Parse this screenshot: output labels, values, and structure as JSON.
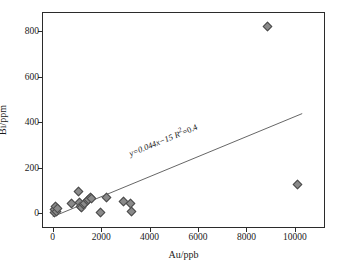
{
  "chart_data": {
    "type": "scatter",
    "title": "",
    "xlabel": "Au/ppb",
    "ylabel": "Bi/ppm",
    "xlim": [
      -400,
      11200
    ],
    "ylim": [
      -60,
      880
    ],
    "xticks": [
      0,
      2000,
      4000,
      6000,
      8000,
      10000
    ],
    "xticklabels": [
      "0",
      "2000",
      "4000",
      "6000",
      "8000",
      "10000"
    ],
    "yticks": [
      0,
      200,
      400,
      600,
      800
    ],
    "yticklabels": [
      "0",
      "200",
      "400",
      "600",
      "800"
    ],
    "grid": false,
    "legend": null,
    "marker": "diamond",
    "marker_color": "#8a8a8a",
    "marker_edge_color": "#4a4a4a",
    "line_color": "#555555",
    "frame_color": "#2b2b2b",
    "points": [
      {
        "x": 60,
        "y": 5
      },
      {
        "x": 80,
        "y": 18
      },
      {
        "x": 120,
        "y": 28
      },
      {
        "x": 150,
        "y": 10
      },
      {
        "x": 210,
        "y": 22
      },
      {
        "x": 760,
        "y": 42
      },
      {
        "x": 1080,
        "y": 98
      },
      {
        "x": 1100,
        "y": 48
      },
      {
        "x": 1130,
        "y": 30
      },
      {
        "x": 1180,
        "y": 26
      },
      {
        "x": 1260,
        "y": 38
      },
      {
        "x": 1310,
        "y": 45
      },
      {
        "x": 1420,
        "y": 55
      },
      {
        "x": 1480,
        "y": 62
      },
      {
        "x": 1560,
        "y": 68
      },
      {
        "x": 1600,
        "y": 66
      },
      {
        "x": 1980,
        "y": 3
      },
      {
        "x": 2220,
        "y": 68
      },
      {
        "x": 2930,
        "y": 54
      },
      {
        "x": 3220,
        "y": 44
      },
      {
        "x": 3250,
        "y": 8
      },
      {
        "x": 8850,
        "y": 820
      },
      {
        "x": 10100,
        "y": 125
      }
    ],
    "trendline": {
      "slope": 0.044,
      "intercept": -15,
      "r_squared": 0.4,
      "x_start": 0,
      "x_end": 10300,
      "equation_text": "y=0.044x−15",
      "r2_text": "R",
      "r2_exponent": "2",
      "r2_value": "=0.4"
    },
    "annotation": {
      "equation_full": "y=0.044x−15 R²=0.4"
    }
  }
}
